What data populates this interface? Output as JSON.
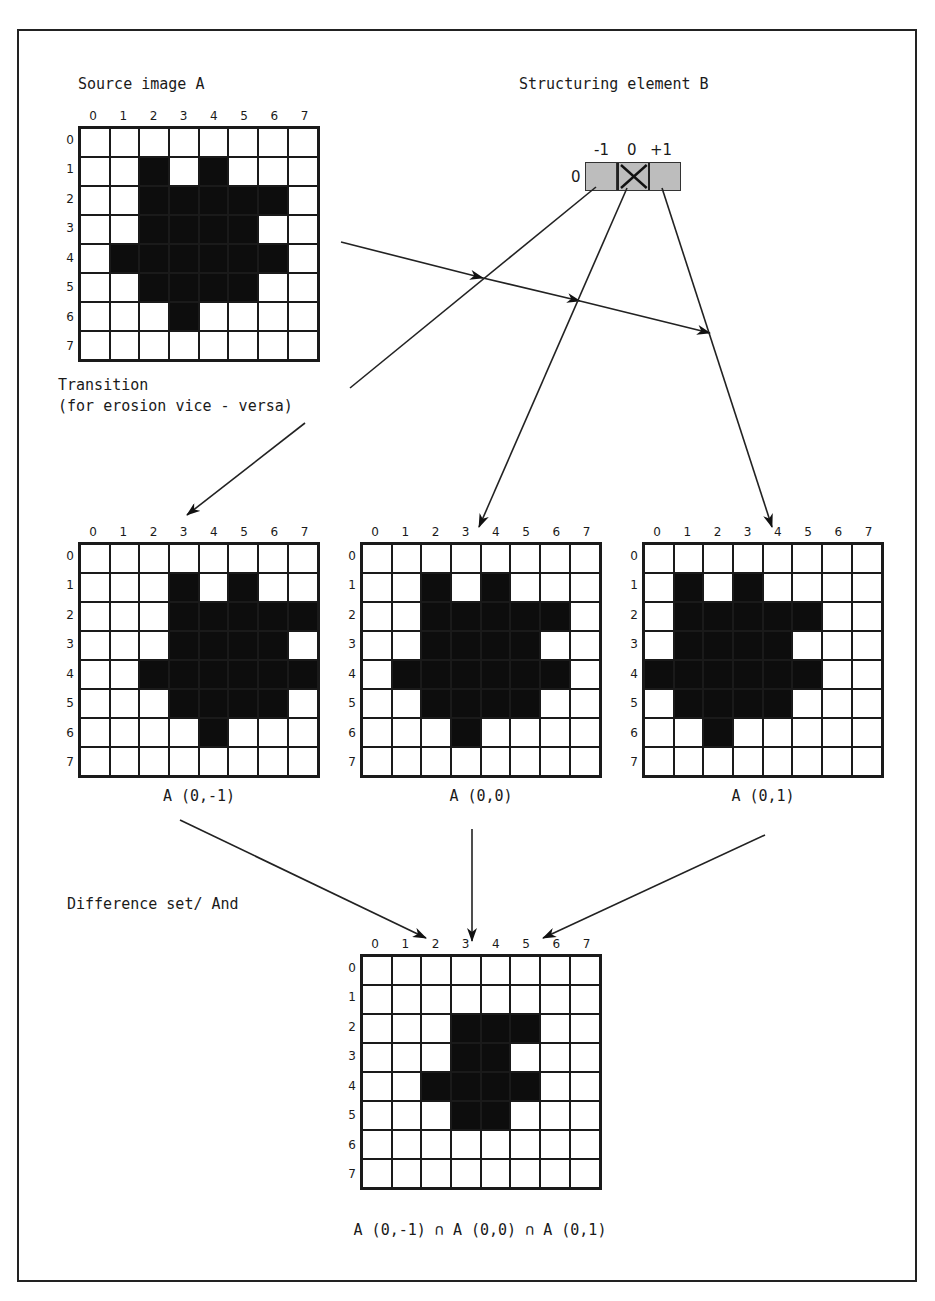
{
  "labels": {
    "source": "Source image A",
    "structuring": "Structuring element B",
    "transition_line1": "Transition",
    "transition_line2": "(for erosion vice - versa)",
    "difference": "Difference set/ And",
    "formula": "A (0,-1) ∩ A (0,0) ∩ A (0,1)"
  },
  "structuring_element": {
    "row_label": "0",
    "col_labels": [
      "-1",
      "0",
      "+1"
    ],
    "origin_index": 1,
    "origin_marker": "x-cross-icon"
  },
  "axis_labels": [
    "0",
    "1",
    "2",
    "3",
    "4",
    "5",
    "6",
    "7"
  ],
  "grids": [
    {
      "id": "source-a",
      "caption": "",
      "rows": [
        [
          0,
          0,
          0,
          0,
          0,
          0,
          0,
          0
        ],
        [
          0,
          0,
          1,
          0,
          1,
          0,
          0,
          0
        ],
        [
          0,
          0,
          1,
          1,
          1,
          1,
          1,
          0
        ],
        [
          0,
          0,
          1,
          1,
          1,
          1,
          0,
          0
        ],
        [
          0,
          1,
          1,
          1,
          1,
          1,
          1,
          0
        ],
        [
          0,
          0,
          1,
          1,
          1,
          1,
          0,
          0
        ],
        [
          0,
          0,
          0,
          1,
          0,
          0,
          0,
          0
        ],
        [
          0,
          0,
          0,
          0,
          0,
          0,
          0,
          0
        ]
      ]
    },
    {
      "id": "a-0-minus1",
      "caption": "A (0,-1)",
      "rows": [
        [
          0,
          0,
          0,
          0,
          0,
          0,
          0,
          0
        ],
        [
          0,
          0,
          0,
          1,
          0,
          1,
          0,
          0
        ],
        [
          0,
          0,
          0,
          1,
          1,
          1,
          1,
          1
        ],
        [
          0,
          0,
          0,
          1,
          1,
          1,
          1,
          0
        ],
        [
          0,
          0,
          1,
          1,
          1,
          1,
          1,
          1
        ],
        [
          0,
          0,
          0,
          1,
          1,
          1,
          1,
          0
        ],
        [
          0,
          0,
          0,
          0,
          1,
          0,
          0,
          0
        ],
        [
          0,
          0,
          0,
          0,
          0,
          0,
          0,
          0
        ]
      ]
    },
    {
      "id": "a-0-0",
      "caption": "A (0,0)",
      "rows": [
        [
          0,
          0,
          0,
          0,
          0,
          0,
          0,
          0
        ],
        [
          0,
          0,
          1,
          0,
          1,
          0,
          0,
          0
        ],
        [
          0,
          0,
          1,
          1,
          1,
          1,
          1,
          0
        ],
        [
          0,
          0,
          1,
          1,
          1,
          1,
          0,
          0
        ],
        [
          0,
          1,
          1,
          1,
          1,
          1,
          1,
          0
        ],
        [
          0,
          0,
          1,
          1,
          1,
          1,
          0,
          0
        ],
        [
          0,
          0,
          0,
          1,
          0,
          0,
          0,
          0
        ],
        [
          0,
          0,
          0,
          0,
          0,
          0,
          0,
          0
        ]
      ]
    },
    {
      "id": "a-0-1",
      "caption": "A (0,1)",
      "rows": [
        [
          0,
          0,
          0,
          0,
          0,
          0,
          0,
          0
        ],
        [
          0,
          1,
          0,
          1,
          0,
          0,
          0,
          0
        ],
        [
          0,
          1,
          1,
          1,
          1,
          1,
          0,
          0
        ],
        [
          0,
          1,
          1,
          1,
          1,
          0,
          0,
          0
        ],
        [
          1,
          1,
          1,
          1,
          1,
          1,
          0,
          0
        ],
        [
          0,
          1,
          1,
          1,
          1,
          0,
          0,
          0
        ],
        [
          0,
          0,
          1,
          0,
          0,
          0,
          0,
          0
        ],
        [
          0,
          0,
          0,
          0,
          0,
          0,
          0,
          0
        ]
      ]
    },
    {
      "id": "result",
      "caption": "",
      "rows": [
        [
          0,
          0,
          0,
          0,
          0,
          0,
          0,
          0
        ],
        [
          0,
          0,
          0,
          0,
          0,
          0,
          0,
          0
        ],
        [
          0,
          0,
          0,
          1,
          1,
          1,
          0,
          0
        ],
        [
          0,
          0,
          0,
          1,
          1,
          0,
          0,
          0
        ],
        [
          0,
          0,
          1,
          1,
          1,
          1,
          0,
          0
        ],
        [
          0,
          0,
          0,
          1,
          1,
          0,
          0,
          0
        ],
        [
          0,
          0,
          0,
          0,
          0,
          0,
          0,
          0
        ],
        [
          0,
          0,
          0,
          0,
          0,
          0,
          0,
          0
        ]
      ]
    }
  ],
  "colors": {
    "ink": "#1a1a1a",
    "filled_cell": "#0d0d0d",
    "empty_cell": "#ffffff",
    "structuring_fill": "#bdbdbd"
  }
}
